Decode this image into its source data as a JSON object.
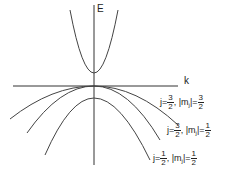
{
  "diagram": {
    "title": "",
    "axes": {
      "y_label": "E",
      "x_label": "k"
    },
    "bands": [
      {
        "name": "conduction-band",
        "label": null
      },
      {
        "name": "heavy-hole-band",
        "j_num": "3",
        "j_den": "2",
        "mj_num": "3",
        "mj_den": "2",
        "label": "j=3/2, |mj|=3/2"
      },
      {
        "name": "light-hole-band",
        "j_num": "3",
        "j_den": "2",
        "mj_num": "1",
        "mj_den": "2",
        "label": "j=3/2, |mj|=1/2"
      },
      {
        "name": "split-off-band",
        "j_num": "1",
        "j_den": "2",
        "mj_num": "1",
        "mj_den": "2",
        "label": "j=1/2, |mj|=1/2"
      }
    ],
    "text": {
      "j_prefix": "j=",
      "sep": ", ",
      "mj_prefix": "|m",
      "mj_sub": "j",
      "mj_suffix": "|="
    },
    "colors": {
      "line": "#333333",
      "background": "#ffffff"
    }
  }
}
